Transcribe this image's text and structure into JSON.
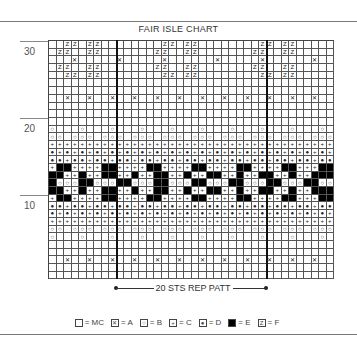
{
  "title": "FAIR ISLE CHART",
  "row_labels": [
    {
      "text": "30",
      "top": 46
    },
    {
      "text": "20",
      "top": 123
    },
    {
      "text": "10",
      "top": 200
    }
  ],
  "grid": {
    "cols": 38,
    "cell_w": 7.5,
    "cell_h": 7.7,
    "dividers_after_col": [
      9,
      29
    ],
    "rows": [
      "..zz.zz........zz.zz........zz.zz.....",
      ".zz..zz.......zz..zz.......zz..zz.....",
      "...x.....x.....x......x.....x......x..",
      ".zz..zz.......zz..zz.......zz..zz.....",
      "..zz.zz........zz.zz........zz.zz.....",
      "......................................",
      "......................................",
      "..x..x..x..x..x..x..x..x..x..x..x..x..",
      "......................................",
      "......................................",
      "......................................",
      "o...o...o...o...o...o...o...o...o...o.",
      "oo.ooo.ooo.ooo.ooo.ooo.ooo.ooo.ooo.ooo",
      "++++++++++++++++++++++++++++++++++++++",
      "*+*+*+*+*+*+*+*+*+*+*+*+*+*+*+*+*+*+*+",
      "**+**+**+**+**+**+**+**+**+**+**+**+**",
      "+##++++##++++##++++##++++##++++##+++##",
      "##++#++##++#++##++#++##++#++##++#++###",
      "#ooo##ooo##ooo##ooo##ooo##ooo##ooo##oo",
      "##++#++##++#++##++#++##++#++##++#++###",
      "+##++++##++++##++++##++++##++++##+++##",
      "**+**+**+**+**+**+**+**+**+**+**+**+**",
      "*+*+*+*+*+*+*+*+*+*+*+*+*+*+*+*+*+*+*+",
      "++++++++++++++++++++++++++++++++++++++",
      "oo.ooo.ooo.ooo.ooo.ooo.ooo.ooo.ooo.ooo",
      "o...o...o...o...o...o...o...o...o...o.",
      "......................................",
      "......................................",
      "..x..x..x..x..x..x..x..x..x..x..x..x..",
      "......................................",
      "......................................"
    ]
  },
  "symbols": {
    ".": {
      "class": "MC",
      "glyph": ""
    },
    "x": {
      "class": "A",
      "glyph": "✕"
    },
    "o": {
      "class": "B",
      "glyph": "○"
    },
    "+": {
      "class": "C",
      "glyph": "+"
    },
    "*": {
      "class": "D",
      "glyph": "●"
    },
    "#": {
      "class": "E",
      "glyph": ""
    },
    "z": {
      "class": "F",
      "glyph": "Z"
    }
  },
  "repeat": {
    "label": "20 STS REP PATT"
  },
  "legend": [
    {
      "glyph": "",
      "cls": "MC",
      "text": "= MC"
    },
    {
      "glyph": "✕",
      "cls": "A",
      "text": "= A"
    },
    {
      "glyph": "○",
      "cls": "B",
      "text": "= B"
    },
    {
      "glyph": "+",
      "cls": "C",
      "text": "= C"
    },
    {
      "glyph": "●",
      "cls": "D",
      "text": "= D"
    },
    {
      "glyph": "",
      "cls": "E",
      "text": "= E"
    },
    {
      "glyph": "Z",
      "cls": "F",
      "text": "= F"
    }
  ]
}
